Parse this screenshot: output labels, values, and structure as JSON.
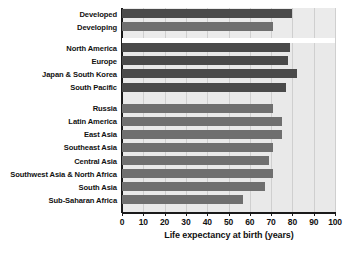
{
  "chart_data": {
    "type": "bar",
    "orientation": "horizontal",
    "title": "",
    "xlabel": "Life expectancy at birth (years)",
    "ylabel": "",
    "xlim": [
      0,
      100
    ],
    "xticks": [
      0,
      10,
      20,
      30,
      40,
      50,
      60,
      70,
      80,
      90,
      100
    ],
    "grid": true,
    "legend": "none",
    "categories": [
      "Developed",
      "Developing",
      "North America",
      "Europe",
      "Japan & South Korea",
      "South Pacific",
      "Russia",
      "Latin America",
      "East Asia",
      "Southeast Asia",
      "Central Asia",
      "Southwest Asia & North Africa",
      "South Asia",
      "Sub-Saharan Africa"
    ],
    "values": [
      80,
      71,
      79,
      78,
      82,
      77,
      71,
      75,
      75,
      71,
      69,
      71,
      67,
      57
    ],
    "bars": [
      {
        "label": "Developed",
        "value": 80,
        "shade": "dark",
        "group": 0
      },
      {
        "label": "Developing",
        "value": 71,
        "shade": "light",
        "group": 0
      },
      {
        "label": "North America",
        "value": 79,
        "shade": "dark",
        "group": 1
      },
      {
        "label": "Europe",
        "value": 78,
        "shade": "dark",
        "group": 1
      },
      {
        "label": "Japan & South Korea",
        "value": 82,
        "shade": "dark",
        "group": 1
      },
      {
        "label": "South Pacific",
        "value": 77,
        "shade": "dark",
        "group": 1
      },
      {
        "label": "Russia",
        "value": 71,
        "shade": "light",
        "group": 2
      },
      {
        "label": "Latin America",
        "value": 75,
        "shade": "light",
        "group": 2
      },
      {
        "label": "East Asia",
        "value": 75,
        "shade": "light",
        "group": 2
      },
      {
        "label": "Southeast Asia",
        "value": 71,
        "shade": "light",
        "group": 2
      },
      {
        "label": "Central Asia",
        "value": 69,
        "shade": "light",
        "group": 2
      },
      {
        "label": "Southwest Asia & North Africa",
        "value": 71,
        "shade": "light",
        "group": 2
      },
      {
        "label": "South Asia",
        "value": 67,
        "shade": "light",
        "group": 2
      },
      {
        "label": "Sub-Saharan Africa",
        "value": 57,
        "shade": "light",
        "group": 2
      }
    ],
    "colors": {
      "bar_dark": "#4a4a4a",
      "bar_light": "#6f6f6f",
      "plot_background": "#e9e9e9",
      "highlight_band": "#ebebeb",
      "gridline": "#cfcfcf",
      "axis": "#1a1a1a",
      "text": "#111111",
      "page_background": "#ffffff"
    }
  }
}
